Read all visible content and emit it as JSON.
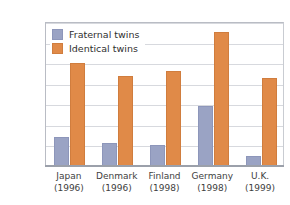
{
  "chart_data": {
    "type": "bar",
    "title": "",
    "xlabel": "",
    "ylabel": "",
    "ylim": [
      0,
      70
    ],
    "yticks": [
      0,
      10,
      20,
      30,
      40,
      50,
      60,
      70
    ],
    "ytick_labels": [
      "0",
      "10",
      "20",
      "30",
      "40",
      "50",
      "60",
      "70%"
    ],
    "grid": true,
    "legend_position": "top-left",
    "categories": [
      "Japan",
      "Denmark",
      "Finland",
      "Germany",
      "U.K."
    ],
    "category_years": [
      "(1996)",
      "(1996)",
      "(1998)",
      "(1998)",
      "(1999)"
    ],
    "series": [
      {
        "name": "Fraternal twins",
        "color": "#9aa3c4",
        "values": [
          14,
          11,
          10,
          29,
          5
        ]
      },
      {
        "name": "Identical twins",
        "color": "#e08a48",
        "values": [
          50,
          44,
          46,
          65,
          43
        ]
      }
    ]
  }
}
